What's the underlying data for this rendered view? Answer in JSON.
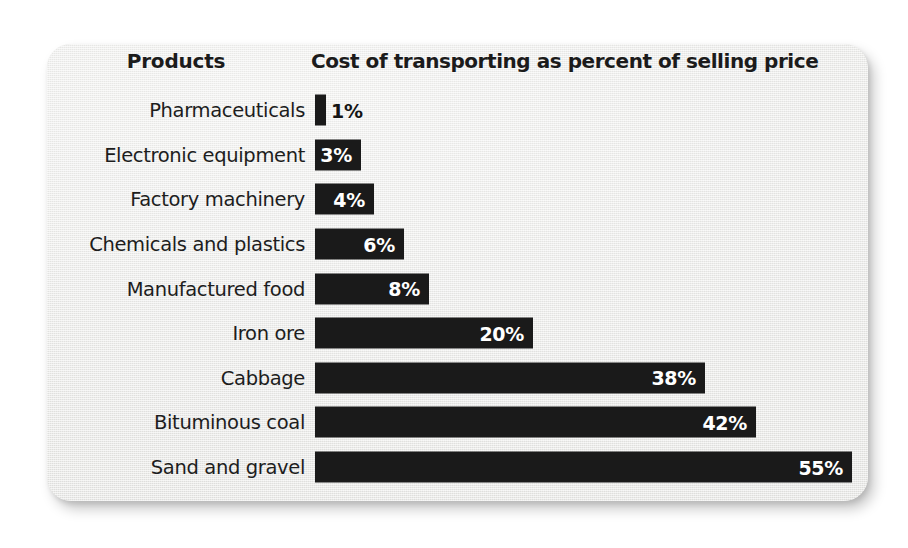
{
  "card": {
    "background_color": "#ececea",
    "bar_color": "#1a1a1a",
    "value_text_color": "#ffffff",
    "label_text_color": "#1d1d1d"
  },
  "header": {
    "products_label": "Products",
    "value_label": "Cost of transporting as percent of selling price"
  },
  "chart_data": {
    "type": "bar",
    "orientation": "horizontal",
    "title": "Cost of transporting as percent of selling price",
    "xlabel": "Cost of transporting as percent of selling price",
    "ylabel": "Products",
    "grid": false,
    "legend": null,
    "xlim": [
      0,
      55
    ],
    "unit": "%",
    "categories": [
      "Pharmaceuticals",
      "Electronic equipment",
      "Factory machinery",
      "Chemicals and plastics",
      "Manufactured food",
      "Iron ore",
      "Cabbage",
      "Bituminous coal",
      "Sand and gravel"
    ],
    "values": [
      1,
      3,
      4,
      6,
      8,
      20,
      38,
      42,
      55
    ],
    "value_labels": [
      "1%",
      "3%",
      "4%",
      "6%",
      "8%",
      "20%",
      "38%",
      "42%",
      "55%"
    ],
    "bars": [
      {
        "category": "Pharmaceuticals",
        "value": 1,
        "label": "1%",
        "bar_width_px": 11,
        "label_inside": false
      },
      {
        "category": "Electronic equipment",
        "value": 3,
        "label": "3%",
        "bar_width_px": 46,
        "label_inside": true
      },
      {
        "category": "Factory machinery",
        "value": 4,
        "label": "4%",
        "bar_width_px": 59,
        "label_inside": true
      },
      {
        "category": "Chemicals and plastics",
        "value": 6,
        "label": "6%",
        "bar_width_px": 89,
        "label_inside": true
      },
      {
        "category": "Manufactured food",
        "value": 8,
        "label": "8%",
        "bar_width_px": 114,
        "label_inside": true
      },
      {
        "category": "Iron ore",
        "value": 20,
        "label": "20%",
        "bar_width_px": 218,
        "label_inside": true
      },
      {
        "category": "Cabbage",
        "value": 38,
        "label": "38%",
        "bar_width_px": 390,
        "label_inside": true
      },
      {
        "category": "Bituminous coal",
        "value": 42,
        "label": "42%",
        "bar_width_px": 441,
        "label_inside": true
      },
      {
        "category": "Sand and gravel",
        "value": 55,
        "label": "55%",
        "bar_width_px": 537,
        "label_inside": true
      }
    ]
  }
}
